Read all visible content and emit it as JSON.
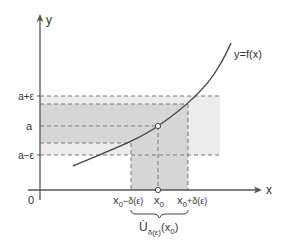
{
  "figure": {
    "colors": {
      "axis": "#555555",
      "curve": "#444444",
      "dash": "#777777",
      "band_dark": "#d6d6d6",
      "band_light": "#ececec",
      "text": "#333333"
    },
    "axes": {
      "x_label": "x",
      "y_label": "y",
      "origin_label": "0"
    },
    "curve_label": "y=f(x)",
    "y_ticks": {
      "upper": "a+ε",
      "center": "a",
      "lower": "a−ε"
    },
    "x_ticks": {
      "left_main": "x",
      "left_sub": "0",
      "left_rest": "−δ(ε)",
      "center_main": "x",
      "center_sub": "0",
      "right_main": "x",
      "right_sub": "0",
      "right_rest": "+δ(ε)"
    },
    "neighborhood": {
      "symbol": "U̇",
      "sub": "δ(ε)",
      "arg": "(x",
      "arg_sub": "0",
      "arg_close": ")"
    }
  }
}
